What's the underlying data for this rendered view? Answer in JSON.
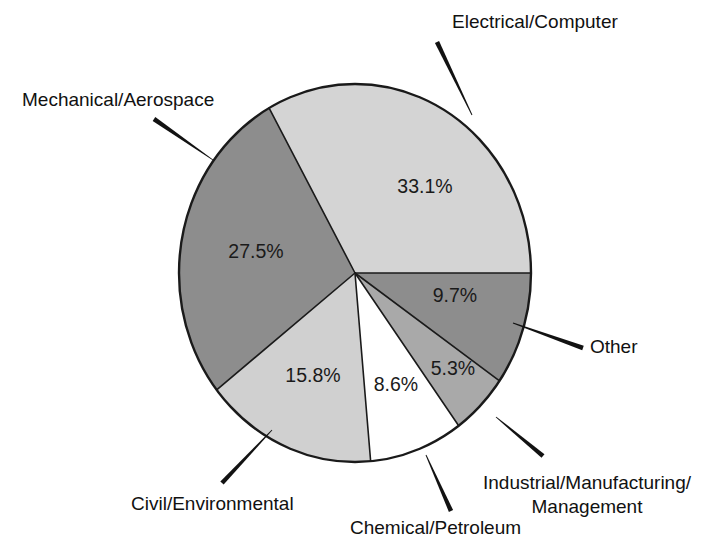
{
  "chart_data": {
    "type": "pie",
    "title": "",
    "subtitle": "",
    "xlabel": "",
    "ylabel": "",
    "legend_position": "callout-labels",
    "grid": false,
    "units": "percent",
    "categories": [
      "Electrical/Computer",
      "Mechanical/Aerospace",
      "Civil/Environmental",
      "Chemical/Petroleum",
      "Industrial/Manufacturing/ Management",
      "Other"
    ],
    "values": [
      33.1,
      27.5,
      15.8,
      8.6,
      5.3,
      9.7
    ],
    "value_labels": [
      "33.1%",
      "27.5%",
      "15.8%",
      "8.6%",
      "5.3%",
      "9.7%"
    ],
    "total": 100.0,
    "slices": [
      {
        "label": "Electrical/Computer",
        "value": 33.1,
        "value_label": "33.1%",
        "color": "#d4d4d4",
        "start_angle_deg": 0.0,
        "end_angle_deg": 119.2,
        "value_x": 425,
        "value_y": 188,
        "callout": {
          "label_lines": [
            "Electrical/Computer"
          ],
          "text_x": 452,
          "text_y": 23,
          "anchor": "start",
          "leader_tip_x": 472,
          "leader_tip_y": 115,
          "leader_tail_x": 437,
          "leader_tail_y": 42
        }
      },
      {
        "label": "Mechanical/Aerospace",
        "value": 27.5,
        "value_label": "27.5%",
        "color": "#8d8d8d",
        "start_angle_deg": 119.2,
        "end_angle_deg": 218.2,
        "value_x": 256,
        "value_y": 253,
        "callout": {
          "label_lines": [
            "Mechanical/Aerospace"
          ],
          "text_x": 22,
          "text_y": 101,
          "anchor": "start",
          "leader_tip_x": 213,
          "leader_tip_y": 160,
          "leader_tail_x": 154,
          "leader_tail_y": 119
        }
      },
      {
        "label": "Civil/Environmental",
        "value": 15.8,
        "value_label": "15.8%",
        "color": "#d0d0d0",
        "start_angle_deg": 218.2,
        "end_angle_deg": 275.1,
        "value_x": 313,
        "value_y": 377,
        "callout": {
          "label_lines": [
            "Civil/Environmental"
          ],
          "text_x": 131,
          "text_y": 505,
          "anchor": "start",
          "leader_tip_x": 272,
          "leader_tip_y": 430,
          "leader_tail_x": 222,
          "leader_tail_y": 483
        }
      },
      {
        "label": "Chemical/Petroleum",
        "value": 8.6,
        "value_label": "8.6%",
        "color": "#ffffff",
        "start_angle_deg": 275.1,
        "end_angle_deg": 306.1,
        "value_x": 396,
        "value_y": 386,
        "callout": {
          "label_lines": [
            "Chemical/Petroleum"
          ],
          "text_x": 350,
          "text_y": 529,
          "anchor": "start",
          "leader_tip_x": 426,
          "leader_tip_y": 455,
          "leader_tail_x": 451,
          "leader_tail_y": 511
        }
      },
      {
        "label": "Industrial/Manufacturing/ Management",
        "value": 5.3,
        "value_label": "5.3%",
        "color": "#a9a9a9",
        "start_angle_deg": 306.1,
        "end_angle_deg": 325.2,
        "value_x": 453,
        "value_y": 370,
        "callout": {
          "label_lines": [
            "Industrial/Manufacturing/",
            "Management"
          ],
          "text_x": 587,
          "text_y": 484,
          "anchor": "middle",
          "leader_tip_x": 496,
          "leader_tip_y": 417,
          "leader_tail_x": 543,
          "leader_tail_y": 456
        }
      },
      {
        "label": "Other",
        "value": 9.7,
        "value_label": "9.7%",
        "color": "#8d8d8d",
        "start_angle_deg": 325.2,
        "end_angle_deg": 360.0,
        "value_x": 455,
        "value_y": 297,
        "callout": {
          "label_lines": [
            "Other"
          ],
          "text_x": 590,
          "text_y": 348,
          "anchor": "start",
          "leader_tip_x": 513,
          "leader_tip_y": 323,
          "leader_tail_x": 583,
          "leader_tail_y": 348
        }
      }
    ],
    "geometry": {
      "center_x": 355,
      "center_y": 273,
      "radius_x": 176,
      "radius_y": 189,
      "outline_color": "#1a1a1a",
      "outline_width": 2.4,
      "divider_color": "#1a1a1a",
      "divider_width": 1.6,
      "background": "#ffffff"
    }
  }
}
